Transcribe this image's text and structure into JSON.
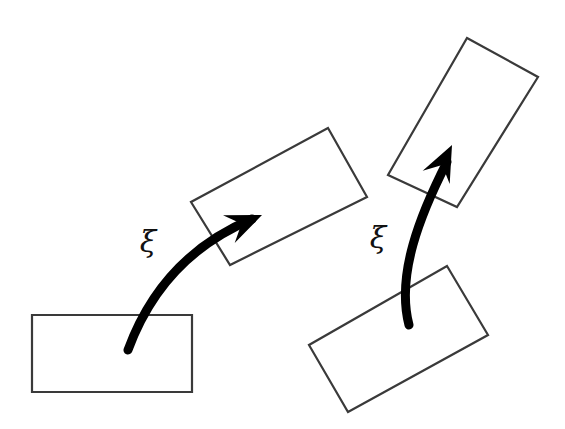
{
  "figure": {
    "background_color": "#ffffff",
    "width": 565,
    "height": 429,
    "shape_stroke_color": "#3a3a3a",
    "shape_stroke_width": 2.2,
    "arrow_color": "#000000",
    "label_color": "#111111"
  },
  "shapes": [
    {
      "name": "source-rectangle-left",
      "role": "initial-pose",
      "points": "32,315 192,315 192,392 32,392",
      "rotation_deg": 0
    },
    {
      "name": "target-rectangle-left",
      "role": "transformed-pose",
      "points": "328,128 367,197 230,265 191,202",
      "rotation_deg": -29
    },
    {
      "name": "source-rectangle-right",
      "role": "initial-pose",
      "points": "447,266 488,335 348,412 309,345",
      "rotation_deg": 29
    },
    {
      "name": "target-rectangle-right",
      "role": "transformed-pose",
      "points": "467,38 538,77 457,207 388,175",
      "rotation_deg": 61
    }
  ],
  "arrows": [
    {
      "name": "twist-arrow-left",
      "path": "M 128,350 C 150,290 190,245 252,219",
      "tip": "262,215",
      "head_angle_deg": -23,
      "width": 9
    },
    {
      "name": "twist-arrow-right",
      "path": "M 409,325 C 396,275 420,215 447,162",
      "tip": "452,145",
      "head_angle_deg": -64,
      "width": 9
    }
  ],
  "labels": [
    {
      "name": "xi-label-left",
      "text": "ξ",
      "x": 148,
      "y": 252
    },
    {
      "name": "xi-label-right",
      "text": "ξ",
      "x": 378,
      "y": 248
    }
  ]
}
